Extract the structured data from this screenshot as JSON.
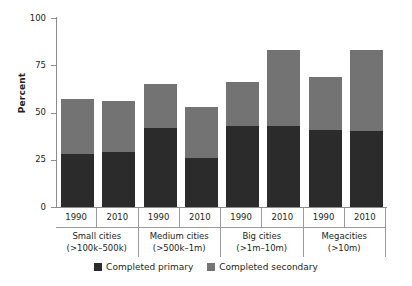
{
  "chart_data": {
    "type": "bar",
    "subtype": "stacked",
    "title": "",
    "xlabel": "",
    "ylabel": "Percent",
    "ylim": [
      0,
      100
    ],
    "yticks": [
      0,
      25,
      50,
      75,
      100
    ],
    "ytick_labels": [
      "0",
      "25",
      "50",
      "75",
      "100"
    ],
    "grid": false,
    "legend_position": "bottom",
    "categories": [
      "1990",
      "2010",
      "1990",
      "2010",
      "1990",
      "2010",
      "1990",
      "2010"
    ],
    "groups": [
      {
        "name": "Small cities",
        "range": "(>100k–500k)",
        "years": [
          "1990",
          "2010"
        ]
      },
      {
        "name": "Medium cities",
        "range": "(>500k–1m)",
        "years": [
          "1990",
          "2010"
        ]
      },
      {
        "name": "Big cities",
        "range": "(>1m–10m)",
        "years": [
          "1990",
          "2010"
        ]
      },
      {
        "name": "Megacities",
        "range": "(>10m)",
        "years": [
          "1990",
          "2010"
        ]
      }
    ],
    "series": [
      {
        "name": "Completed primary",
        "color": "#2b2b2b",
        "values": [
          28,
          29,
          42,
          26,
          43,
          43,
          41,
          40
        ]
      },
      {
        "name": "Completed secondary",
        "color": "#737373",
        "values": [
          29,
          27,
          23,
          27,
          23,
          40,
          28,
          43
        ]
      }
    ],
    "totals": [
      57,
      56,
      65,
      53,
      66,
      83,
      69,
      83
    ],
    "legend": [
      "Completed primary",
      "Completed secondary"
    ],
    "colors": {
      "primary": "#2b2b2b",
      "secondary": "#737373",
      "axis": "#8c8c8c",
      "text": "#231f20",
      "background": "#ffffff"
    }
  }
}
